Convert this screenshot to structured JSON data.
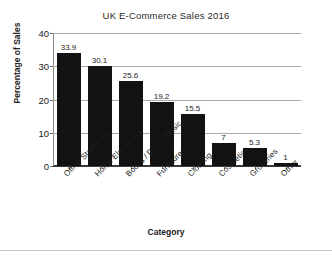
{
  "chart_data": {
    "type": "bar",
    "title": "UK E-Commerce Sales 2016",
    "xlabel": "Category",
    "ylabel": "Percentage of Sales",
    "categories": [
      "Office Stationery",
      "Home Electronics",
      "Books / DVD / Music",
      "Furniture",
      "Clothing",
      "Cosmetics",
      "Groceries",
      "Other"
    ],
    "values": [
      33.9,
      30.1,
      25.6,
      19.2,
      15.5,
      7,
      5.3,
      1
    ],
    "value_labels": [
      "33.9",
      "30.1",
      "25.6",
      "19.2",
      "15.5",
      "7",
      "5.3",
      "1"
    ],
    "ylim": [
      0,
      40
    ],
    "yticks": [
      0,
      10,
      20,
      30,
      40
    ],
    "ytick_labels": [
      "0",
      "10",
      "20",
      "30",
      "40"
    ],
    "grid": true,
    "grid_axis": "y",
    "legend": false,
    "bar_color": "#121212",
    "gridline_color": "#a9a9a9",
    "background_color": "#ffffff"
  }
}
